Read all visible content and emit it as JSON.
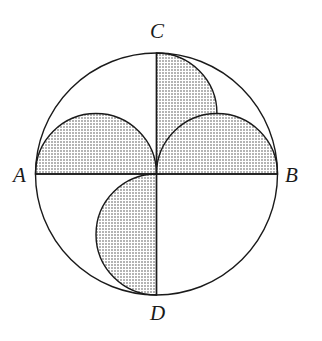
{
  "figure": {
    "background_color": "#ffffff",
    "stroke_color": "#1a1a1a",
    "shade_color": "#c8c8c8",
    "shade_pattern": "halftone-dots",
    "stroke_width": 1.4,
    "circle": {
      "name": "main-circle",
      "center_x": 156.5,
      "center_y": 174,
      "radius": 121
    },
    "diameters": [
      {
        "name": "diameter-AB",
        "orientation": "horizontal",
        "from": "A",
        "to": "B"
      },
      {
        "name": "diameter-CD",
        "orientation": "vertical",
        "from": "C",
        "to": "D"
      }
    ],
    "points": [
      {
        "id": "A",
        "label": "A",
        "x": 35.5,
        "y": 174,
        "label_x": 13,
        "label_y": 165
      },
      {
        "id": "B",
        "label": "B",
        "x": 277.5,
        "y": 174,
        "label_x": 285,
        "label_y": 165
      },
      {
        "id": "C",
        "label": "C",
        "x": 156.5,
        "y": 53,
        "label_x": 150,
        "label_y": 21
      },
      {
        "id": "D",
        "label": "D",
        "x": 156.5,
        "y": 295,
        "label_x": 150,
        "label_y": 303
      },
      {
        "id": "O",
        "label": "",
        "x": 156.5,
        "y": 174,
        "label_x": 0,
        "label_y": 0
      }
    ],
    "lobes": [
      {
        "name": "lobe-top-left",
        "diameter_from": "A",
        "diameter_to": "O",
        "bulge": "up",
        "shaded": true,
        "center_x": 96,
        "center_y": 174,
        "radius": 60.5
      },
      {
        "name": "lobe-top-right",
        "diameter_from": "O",
        "diameter_to": "C",
        "bulge": "right",
        "shaded": true,
        "center_x": 156.5,
        "center_y": 113.5,
        "radius": 60.5
      },
      {
        "name": "lobe-bottom-right",
        "diameter_from": "O",
        "diameter_to": "B",
        "bulge": "down",
        "shaded": true,
        "center_x": 217,
        "center_y": 174,
        "radius": 60.5
      },
      {
        "name": "lobe-bottom-left",
        "diameter_from": "O",
        "diameter_to": "D",
        "bulge": "left",
        "shaded": true,
        "center_x": 156.5,
        "center_y": 234.5,
        "radius": 60.5
      }
    ]
  }
}
